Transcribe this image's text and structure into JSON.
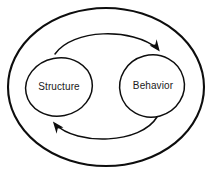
{
  "diagram": {
    "background_color": "#ffffff",
    "stroke_color": "#0d0d0d",
    "label_color": "#1a1a1a",
    "boundary": {
      "name": "system-boundary",
      "shape": "ellipse",
      "label": ""
    },
    "nodes": [
      {
        "id": "structure",
        "label": "Structure",
        "shape": "ellipse",
        "position": "left"
      },
      {
        "id": "behavior",
        "label": "Behavior",
        "shape": "ellipse",
        "position": "right"
      }
    ],
    "edges": [
      {
        "id": "structure-to-behavior",
        "from": "structure",
        "to": "behavior",
        "label": "",
        "style": "curved-arrow",
        "route": "top"
      },
      {
        "id": "behavior-to-structure",
        "from": "behavior",
        "to": "structure",
        "label": "",
        "style": "curved-arrow",
        "route": "bottom"
      }
    ]
  }
}
